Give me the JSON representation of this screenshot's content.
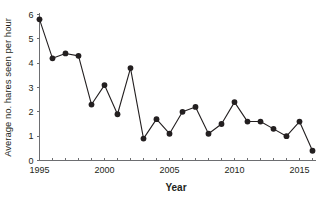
{
  "chart_data": {
    "type": "line",
    "title": "",
    "subtitle": "",
    "xlabel": "Year",
    "ylabel": "Average no. hares seen per hour",
    "x": [
      1995,
      1996,
      1997,
      1998,
      1999,
      2000,
      2001,
      2002,
      2003,
      2004,
      2005,
      2006,
      2007,
      2008,
      2009,
      2010,
      2011,
      2012,
      2013,
      2014,
      2015,
      2016
    ],
    "values": [
      5.8,
      4.2,
      4.4,
      4.3,
      2.3,
      3.1,
      1.9,
      3.8,
      0.9,
      1.7,
      1.1,
      2.0,
      2.2,
      1.1,
      1.5,
      2.4,
      1.6,
      1.6,
      1.3,
      1.0,
      1.6,
      0.4
    ],
    "series": [
      {
        "name": "Average no. hares seen per hour",
        "values": [
          5.8,
          4.2,
          4.4,
          4.3,
          2.3,
          3.1,
          1.9,
          3.8,
          0.9,
          1.7,
          1.1,
          2.0,
          2.2,
          1.1,
          1.5,
          2.4,
          1.6,
          1.6,
          1.3,
          1.0,
          1.6,
          0.4
        ],
        "color": "#231f20",
        "marker": "circle"
      }
    ],
    "xlim": [
      1995,
      2016
    ],
    "ylim": [
      0,
      6
    ],
    "yticks": [
      0,
      1,
      2,
      3,
      4,
      5,
      6
    ],
    "ytick_labels": [
      "0",
      "1",
      "2",
      "3",
      "4",
      "5",
      "6"
    ],
    "xticks": [
      1995,
      1996,
      1997,
      1998,
      1999,
      2000,
      2001,
      2002,
      2003,
      2004,
      2005,
      2006,
      2007,
      2008,
      2009,
      2010,
      2011,
      2012,
      2013,
      2014,
      2015,
      2016
    ],
    "xtick_labels_shown": [
      "1995",
      "2000",
      "2005",
      "2010",
      "2015"
    ],
    "xtick_labels_shown_values": [
      1995,
      2000,
      2005,
      2010,
      2015
    ],
    "grid": false,
    "legend": false,
    "legend_position": "none",
    "axis_color": "#6d6e71",
    "line_color": "#231f20",
    "marker_color": "#231f20",
    "background_color": "#ffffff"
  }
}
